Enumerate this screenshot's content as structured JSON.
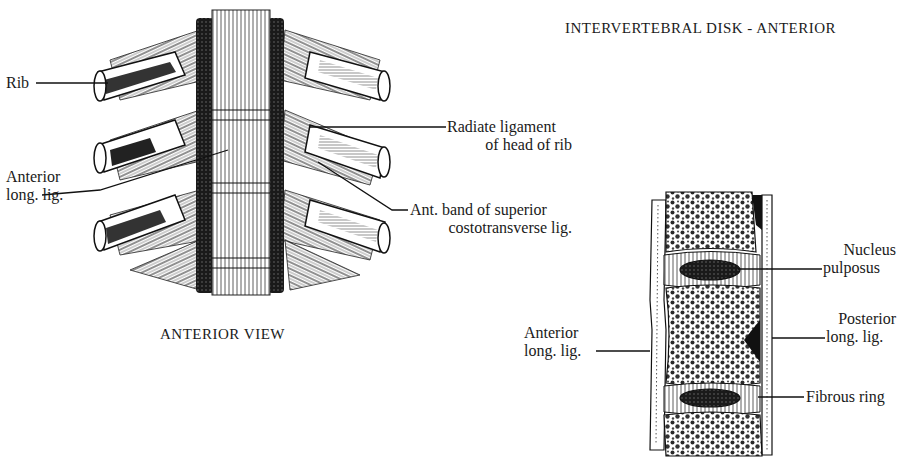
{
  "title": "INTERVERTEBRAL DISK - ANTERIOR",
  "anterior_view": {
    "caption": "ANTERIOR VIEW",
    "labels": {
      "rib": "Rib",
      "anterior_long_lig_line1": "Anterior",
      "anterior_long_lig_line2": "long. lig.",
      "radiate_line1": "Radiate ligament",
      "radiate_line2": "of head of rib",
      "ant_band_line1": "Ant. band of superior",
      "ant_band_line2": "costotransverse lig."
    }
  },
  "disk_section": {
    "labels": {
      "nucleus_line1": "Nucleus",
      "nucleus_line2": "pulposus",
      "posterior_line1": "Posterior",
      "posterior_line2": "long. lig.",
      "anterior_line1": "Anterior",
      "anterior_line2": "long. lig.",
      "fibrous_ring": "Fibrous ring"
    }
  },
  "colors": {
    "ink": "#1a1a1a",
    "paper": "#ffffff"
  }
}
